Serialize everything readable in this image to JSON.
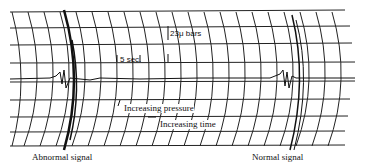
{
  "figure": {
    "labels": {
      "bar_scale": "23μ bars",
      "time_scale": "5 sec.",
      "pressure_arrow": "Increasing pressure",
      "time_arrow": "Increasing time",
      "left_caption": "Abnormal signal",
      "right_caption": "Normal signal"
    },
    "colors": {
      "ink": "#111111",
      "paper": "#ffffff"
    }
  }
}
